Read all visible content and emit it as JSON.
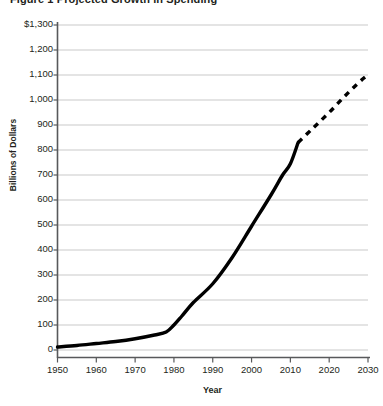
{
  "chart_data": {
    "type": "line",
    "title": "Figure 1  Projected Growth in Spending",
    "xlabel": "Year",
    "ylabel": "Billions of Dollars",
    "xlim": [
      1950,
      2030
    ],
    "ylim": [
      0,
      1300
    ],
    "grid": true,
    "legend": null,
    "x_ticks": [
      "1950",
      "1960",
      "1970",
      "1980",
      "1990",
      "2000",
      "2010",
      "2020",
      "2030"
    ],
    "y_ticks": [
      "$1,300",
      "1,200",
      "1,100",
      "1,000",
      "900",
      "800",
      "700",
      "600",
      "500",
      "400",
      "300",
      "200",
      "100",
      "0"
    ],
    "series": [
      {
        "name": "Actual",
        "style": "solid",
        "color": "#000000",
        "x": [
          1950,
          1955,
          1960,
          1965,
          1970,
          1975,
          1978,
          1980,
          1982,
          1985,
          1990,
          1995,
          2000,
          2005,
          2008,
          2010,
          2012
        ],
        "values": [
          12,
          18,
          26,
          34,
          45,
          60,
          72,
          100,
          135,
          190,
          265,
          370,
          495,
          620,
          700,
          745,
          830
        ]
      },
      {
        "name": "Projected",
        "style": "dashed",
        "color": "#000000",
        "x": [
          2012,
          2016,
          2020,
          2024,
          2028,
          2030
        ],
        "values": [
          830,
          890,
          950,
          1015,
          1075,
          1100
        ]
      }
    ],
    "annotations": [
      {
        "text": "Solid line shows historical values through 2012; dashed line shows projection to 2030."
      }
    ]
  },
  "axis": {
    "y_title": "Billions of Dollars",
    "x_title": "Year"
  },
  "colors": {
    "gridline": "#c9c9c9",
    "axis": "#58595b",
    "data_line": "#000000",
    "text": "#231f20",
    "background": "#ffffff"
  }
}
